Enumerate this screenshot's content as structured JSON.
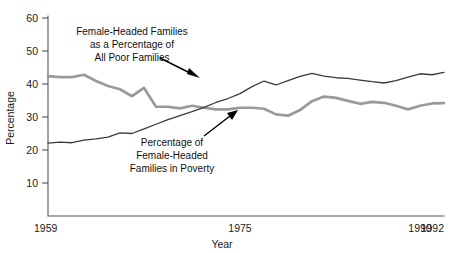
{
  "chart_data": {
    "type": "line",
    "title": "",
    "xlabel": "Year",
    "ylabel": "Percentage",
    "xlim": [
      1959,
      1992
    ],
    "ylim": [
      0,
      60
    ],
    "ytick_labels": [
      "10",
      "20",
      "30",
      "40",
      "50",
      "60"
    ],
    "ytick_values": [
      10,
      20,
      30,
      40,
      50,
      60
    ],
    "xtick_labels": [
      "1959",
      "1975",
      "1990",
      "1992"
    ],
    "xtick_values": [
      1959,
      1975,
      1990,
      1992
    ],
    "grid": false,
    "legend": "none (inline annotations with arrows)",
    "x": [
      1959,
      1960,
      1961,
      1962,
      1963,
      1964,
      1965,
      1966,
      1967,
      1968,
      1969,
      1970,
      1971,
      1972,
      1973,
      1974,
      1975,
      1976,
      1977,
      1978,
      1979,
      1980,
      1981,
      1982,
      1983,
      1984,
      1985,
      1986,
      1987,
      1988,
      1989,
      1990,
      1991,
      1992
    ],
    "series": [
      {
        "name": "Female-Headed Families as a Percentage of All Poor Families",
        "style": "thin dark line",
        "color": "#3a3a3a",
        "values": [
          22.1,
          22.4,
          22.2,
          23.0,
          23.4,
          23.9,
          25.2,
          25.0,
          26.4,
          27.8,
          29.2,
          30.4,
          31.6,
          32.9,
          34.4,
          35.6,
          37.1,
          39.2,
          40.9,
          39.7,
          41.0,
          42.3,
          43.2,
          42.4,
          41.9,
          41.7,
          41.2,
          40.7,
          40.3,
          41.0,
          42.1,
          43.1,
          42.8,
          43.5
        ]
      },
      {
        "name": "Percentage of Female-Headed Families in Poverty",
        "style": "thick gray line",
        "color": "#9a9a9a",
        "values": [
          42.4,
          42.1,
          42.1,
          42.8,
          40.9,
          39.4,
          38.4,
          36.3,
          38.8,
          33.1,
          33.1,
          32.6,
          33.4,
          32.8,
          32.3,
          32.3,
          32.8,
          32.8,
          32.5,
          30.8,
          30.4,
          32.1,
          34.8,
          36.2,
          35.8,
          34.9,
          34.0,
          34.6,
          34.3,
          33.4,
          32.3,
          33.4,
          34.1,
          34.2
        ]
      }
    ],
    "annotations": [
      {
        "id": "annot-upper",
        "lines": [
          "Female-Headed Families",
          "as a Percentage of",
          "All Poor Families"
        ],
        "arrow_points_to": "thin dark line near 1973"
      },
      {
        "id": "annot-lower",
        "lines": [
          "Percentage of",
          "Female-Headed",
          "Families in Poverty"
        ],
        "arrow_points_to": "thick gray line near 1977"
      }
    ]
  },
  "axes": {
    "y_title": "Percentage",
    "x_title": "Year"
  }
}
